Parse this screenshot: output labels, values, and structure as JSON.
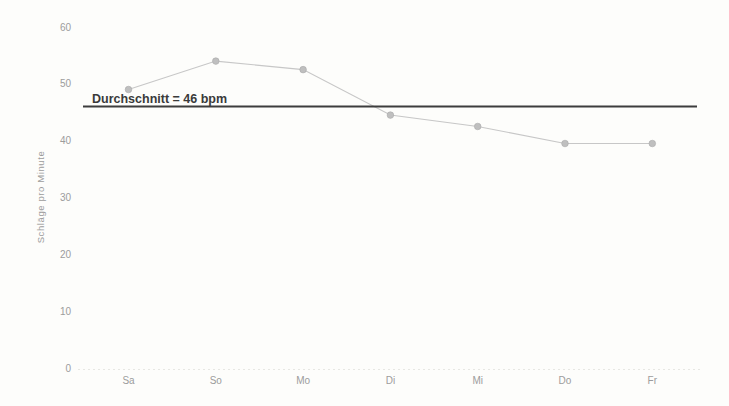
{
  "chart_data": {
    "type": "line",
    "title": "",
    "xlabel": "",
    "ylabel": "Schläge pro Minute",
    "categories": [
      "Sa",
      "So",
      "Mo",
      "Di",
      "Mi",
      "Do",
      "Fr"
    ],
    "values": [
      49,
      54,
      52.5,
      44.5,
      42.5,
      39.5,
      39.5
    ],
    "unit": "bpm",
    "average": 46,
    "annotation": "Durchschnitt = 46 bpm",
    "ylim": [
      0,
      60
    ],
    "yticks": [
      0,
      10,
      20,
      30,
      40,
      50,
      60
    ],
    "grid": false,
    "legend": false,
    "colors": {
      "background": "#fdfdfb",
      "data_line": "#c7c7c7",
      "marker_fill": "#bfbfbf",
      "marker_edge": "#a9a9a9",
      "average_line": "#3d3d3d",
      "axis_text": "#9c9c9c",
      "annotation_text": "#3a3a3a",
      "baseline": "#e2e2de"
    }
  }
}
